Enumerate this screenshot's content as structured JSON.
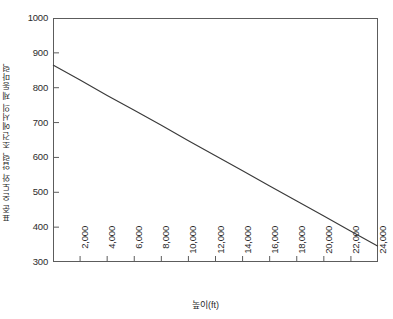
{
  "chart_data": {
    "type": "line",
    "title": "",
    "xlabel": "높이(ft)",
    "ylabel": "표준 온도와 압력 조건에서의 제동마력",
    "xlim": [
      0,
      24000
    ],
    "ylim": [
      300,
      1000
    ],
    "grid": false,
    "legend": "none",
    "x_ticks": [
      2000,
      4000,
      6000,
      8000,
      10000,
      12000,
      14000,
      16000,
      18000,
      20000,
      22000,
      24000
    ],
    "x_tick_labels": [
      "2,000",
      "4,000",
      "6,000",
      "8,000",
      "10,000",
      "12,000",
      "14,000",
      "16,000",
      "18,000",
      "20,000",
      "22,000",
      "24,000"
    ],
    "y_ticks": [
      300,
      400,
      500,
      600,
      700,
      800,
      900,
      1000
    ],
    "y_tick_labels": [
      "300",
      "400",
      "500",
      "600",
      "700",
      "800",
      "900",
      "1000"
    ],
    "series": [
      {
        "name": "brake-horsepower",
        "color": "#3a3a3a",
        "x": [
          0,
          2000,
          4000,
          6000,
          8000,
          10000,
          12000,
          14000,
          16000,
          18000,
          20000,
          22000,
          24000
        ],
        "values": [
          865,
          822,
          778,
          735,
          692,
          648,
          605,
          562,
          518,
          475,
          432,
          388,
          345
        ]
      }
    ]
  },
  "axis_colors": {
    "frame": "#5c5c5c",
    "line": "#3a3a3a",
    "text": "#2b2b2b"
  }
}
